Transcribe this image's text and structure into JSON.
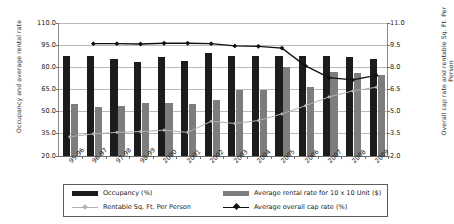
{
  "chart_data": {
    "type": "bar",
    "title": "",
    "xlabel": "",
    "ylabel": "Occupancy and average rental rate",
    "y2label": "Overall cap rate and rentable Sq. Ft. Per Person",
    "categories": [
      "95-96",
      "96-97",
      "97-98",
      "98-99",
      "2000",
      "2001",
      "2002",
      "2003",
      "2004",
      "2005",
      "2006",
      "2007",
      "2008",
      "2009"
    ],
    "ylim": [
      20.0,
      110.0
    ],
    "yticks": [
      20.0,
      35.0,
      50.0,
      65.0,
      80.0,
      95.0,
      110.0
    ],
    "ytick_labels": [
      "20.0",
      "35.0",
      "50.0",
      "65.0",
      "80.0",
      "95.0",
      "110.0"
    ],
    "y2lim": [
      2.0,
      11.0
    ],
    "y2ticks": [
      2.0,
      3.5,
      5.0,
      6.5,
      8.0,
      9.5,
      11.0
    ],
    "y2tick_labels": [
      "2.0",
      "3.5",
      "5.0",
      "6.5",
      "8.0",
      "9.5",
      "11.0"
    ],
    "grid": true,
    "legend_position": "bottom",
    "series": [
      {
        "name": "Occupancy (%)",
        "kind": "bar",
        "axis": "left",
        "color": "#1c1c1c",
        "values": [
          87.5,
          87.5,
          85.5,
          83.5,
          87.0,
          84.5,
          89.5,
          88.0,
          87.5,
          88.0,
          87.5,
          87.5,
          87.0,
          85.5
        ]
      },
      {
        "name": "Average rental rate for 10 x 10 Unit ($)",
        "kind": "bar",
        "axis": "left",
        "color": "#7d7d7d",
        "values": [
          55.5,
          53.0,
          54.0,
          56.0,
          56.0,
          55.0,
          58.0,
          64.5,
          64.5,
          80.0,
          66.5,
          77.0,
          76.0,
          74.5
        ]
      },
      {
        "name": "Rentable Sq. Ft. Per Person",
        "kind": "line",
        "axis": "right",
        "color": "#b0b0b0",
        "values": [
          3.3,
          3.5,
          3.6,
          3.65,
          3.75,
          3.6,
          4.35,
          4.2,
          4.4,
          4.85,
          5.4,
          6.0,
          6.4,
          6.65
        ]
      },
      {
        "name": "Average overall cap rate (%)",
        "kind": "line",
        "axis": "right",
        "color": "#101010",
        "values": [
          null,
          9.6,
          9.6,
          9.58,
          9.63,
          9.63,
          9.6,
          9.45,
          9.42,
          9.3,
          8.1,
          7.3,
          7.15,
          7.45
        ]
      }
    ]
  },
  "legend": {
    "items": [
      {
        "label": "Occupancy (%)",
        "swatch": "bar-black-swatch"
      },
      {
        "label": "Average rental rate for 10 x 10 Unit ($)",
        "swatch": "bar-gray-swatch"
      },
      {
        "label": "Rentable Sq. Ft. Per Person",
        "swatch": "line-gray-swatch"
      },
      {
        "label": "Average overall cap rate (%)",
        "swatch": "line-black-swatch"
      }
    ]
  }
}
